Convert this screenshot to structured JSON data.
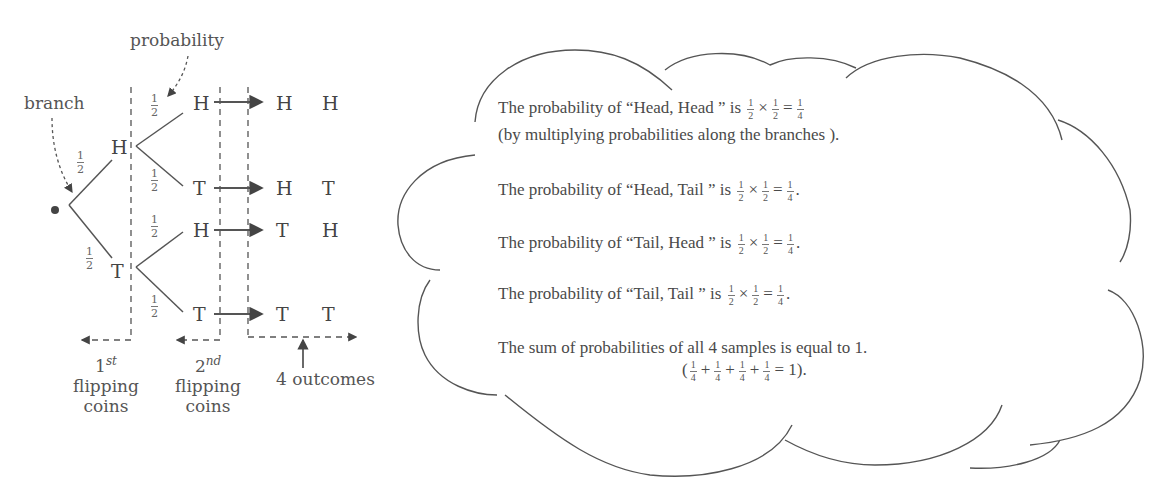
{
  "tree": {
    "annotations": {
      "probability": "probability",
      "branch": "branch"
    },
    "level1": [
      {
        "label": "H",
        "prob_num": "1",
        "prob_den": "2"
      },
      {
        "label": "T",
        "prob_num": "1",
        "prob_den": "2"
      }
    ],
    "level2": [
      {
        "label": "H",
        "prob_num": "1",
        "prob_den": "2"
      },
      {
        "label": "T",
        "prob_num": "1",
        "prob_den": "2"
      },
      {
        "label": "H",
        "prob_num": "1",
        "prob_den": "2"
      },
      {
        "label": "T",
        "prob_num": "1",
        "prob_den": "2"
      }
    ],
    "outcomes": [
      {
        "first": "H",
        "second": "H"
      },
      {
        "first": "H",
        "second": "T"
      },
      {
        "first": "T",
        "second": "H"
      },
      {
        "first": "T",
        "second": "T"
      }
    ],
    "captions": {
      "first": {
        "ordinal_num": "1",
        "ordinal_sup": "st",
        "line2": "flipping",
        "line3": "coins"
      },
      "second": {
        "ordinal_num": "2",
        "ordinal_sup": "nd",
        "line2": "flipping",
        "line3": "coins"
      },
      "outcomes": "4 outcomes"
    }
  },
  "cloud": {
    "lines": [
      {
        "text": "The probability of “Head, Head ” is",
        "a": "1",
        "ad": "2",
        "op": "×",
        "b": "1",
        "bd": "2",
        "eq": "=",
        "r": "1",
        "rd": "4",
        "end": ""
      },
      {
        "text": "(by multiplying probabilities along the branches )."
      },
      {
        "text": "The probability of “Head, Tail ” is",
        "a": "1",
        "ad": "2",
        "op": "×",
        "b": "1",
        "bd": "2",
        "eq": "=",
        "r": "1",
        "rd": "4",
        "end": "."
      },
      {
        "text": "The probability of “Tail, Head ” is",
        "a": "1",
        "ad": "2",
        "op": "×",
        "b": "1",
        "bd": "2",
        "eq": "=",
        "r": "1",
        "rd": "4",
        "end": "."
      },
      {
        "text": "The probability of “Tail, Tail ” is",
        "a": "1",
        "ad": "2",
        "op": "×",
        "b": "1",
        "bd": "2",
        "eq": "=",
        "r": "1",
        "rd": "4",
        "end": "."
      },
      {
        "text": "The sum of probabilities of all 4 samples is equal to 1."
      }
    ],
    "sum": {
      "open": "(",
      "n": "1",
      "d": "4",
      "plus": "+",
      "eq": "= 1)."
    }
  },
  "colors": {
    "stroke": "#555555",
    "text": "#4a4a4a",
    "background": "#ffffff"
  }
}
